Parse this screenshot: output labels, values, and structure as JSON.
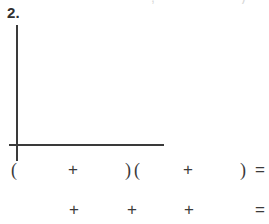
{
  "page": {
    "background_color": "#ffffff",
    "ink_color": "#3a3a3a",
    "width": 269,
    "height": 224
  },
  "problem": {
    "number_label": "2.",
    "type": "blank-graph-and-expression-worksheet"
  },
  "graph": {
    "name": "empty-coordinate-axes",
    "y_axis_label": "",
    "x_axis_label": "",
    "tick_labels": [],
    "gridlines": false,
    "has_plotted_data": false,
    "axis_color": "#3a3a3a"
  },
  "expression_rows": [
    {
      "row_id": "row-1",
      "text": "(        +        )(        +        ) =",
      "symbols": [
        {
          "glyph": "(",
          "x": 11,
          "kind": "paren-open"
        },
        {
          "glyph": "+",
          "x": 68,
          "kind": "plus"
        },
        {
          "glyph": ")",
          "x": 125,
          "kind": "paren-close"
        },
        {
          "glyph": "(",
          "x": 134,
          "kind": "paren-open"
        },
        {
          "glyph": "+",
          "x": 183,
          "kind": "plus"
        },
        {
          "glyph": ")",
          "x": 240,
          "kind": "paren-close"
        },
        {
          "glyph": "=",
          "x": 255,
          "kind": "equals"
        }
      ]
    },
    {
      "row_id": "row-2",
      "text": "        +        +        +        =",
      "symbols": [
        {
          "glyph": "+",
          "x": 69,
          "kind": "plus"
        },
        {
          "glyph": "+",
          "x": 127,
          "kind": "plus"
        },
        {
          "glyph": "+",
          "x": 184,
          "kind": "plus"
        },
        {
          "glyph": "=",
          "x": 255,
          "kind": "equals"
        }
      ]
    }
  ],
  "clipped_top_line": {
    "visible": true,
    "fragments": [
      {
        "glyph": ",",
        "x": 151
      },
      {
        "glyph": ")",
        "x": 241
      }
    ]
  }
}
